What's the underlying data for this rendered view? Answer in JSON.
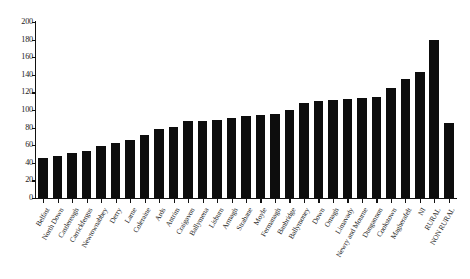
{
  "chart_data": {
    "type": "bar",
    "title": "",
    "subtitle": "",
    "xlabel": "",
    "ylabel": "",
    "ylim": [
      0,
      200
    ],
    "yticks": [
      0,
      20,
      40,
      60,
      80,
      100,
      120,
      140,
      160,
      180,
      200
    ],
    "ytick_labels": [
      "0",
      "20",
      "40",
      "60",
      "80",
      "100",
      "120",
      "140",
      "160",
      "180",
      "200"
    ],
    "grid": false,
    "legend": null,
    "bar_color": "#0d0d0d",
    "axis_color": "#111111",
    "categories": [
      "Belfast",
      "North Down",
      "Castlereagh",
      "Carrickfergus",
      "Newtownabbey",
      "Derry",
      "Larne",
      "Coleraine",
      "Ards",
      "Antrim",
      "Craigavon",
      "Ballymena",
      "Lisburn",
      "Armagh",
      "Strabane",
      "Moyle",
      "Fermanagh",
      "Banbridge",
      "Ballymoney",
      "Down",
      "Omagh",
      "Limavady",
      "Newry and Mourne",
      "Dungannon",
      "Cookstown",
      "Magherafelt",
      "NI",
      "RURAL",
      "NON RURAL"
    ],
    "values": [
      45,
      48,
      51,
      53,
      59,
      63,
      66,
      72,
      78,
      81,
      87,
      88,
      89,
      91,
      93,
      94,
      96,
      100,
      108,
      110,
      111,
      113,
      114,
      115,
      125,
      135,
      143,
      180,
      85
    ],
    "series": [
      {
        "name": "Rate",
        "values": [
          45,
          48,
          51,
          53,
          59,
          63,
          66,
          72,
          78,
          81,
          87,
          88,
          89,
          91,
          93,
          94,
          96,
          100,
          108,
          110,
          111,
          113,
          114,
          115,
          125,
          135,
          143,
          180,
          85
        ]
      }
    ],
    "bars": [
      {
        "label": "Belfast",
        "value": 45
      },
      {
        "label": "North Down",
        "value": 48
      },
      {
        "label": "Castlereagh",
        "value": 51
      },
      {
        "label": "Carrickfergus",
        "value": 53
      },
      {
        "label": "Newtownabbey",
        "value": 59
      },
      {
        "label": "Derry",
        "value": 63
      },
      {
        "label": "Larne",
        "value": 66
      },
      {
        "label": "Coleraine",
        "value": 72
      },
      {
        "label": "Ards",
        "value": 78
      },
      {
        "label": "Antrim",
        "value": 81
      },
      {
        "label": "Craigavon",
        "value": 87
      },
      {
        "label": "Ballymena",
        "value": 88
      },
      {
        "label": "Lisburn",
        "value": 89
      },
      {
        "label": "Armagh",
        "value": 91
      },
      {
        "label": "Strabane",
        "value": 93
      },
      {
        "label": "Moyle",
        "value": 94
      },
      {
        "label": "Fermanagh",
        "value": 96
      },
      {
        "label": "Banbridge",
        "value": 100
      },
      {
        "label": "Ballymoney",
        "value": 108
      },
      {
        "label": "Down",
        "value": 110
      },
      {
        "label": "Omagh",
        "value": 111
      },
      {
        "label": "Limavady",
        "value": 113
      },
      {
        "label": "Newry and Mourne",
        "value": 114
      },
      {
        "label": "Dungannon",
        "value": 115
      },
      {
        "label": "Cookstown",
        "value": 125
      },
      {
        "label": "Magherafelt",
        "value": 135
      },
      {
        "label": "NI",
        "value": 143
      },
      {
        "label": "RURAL",
        "value": 180
      },
      {
        "label": "NON RURAL",
        "value": 85
      }
    ]
  }
}
